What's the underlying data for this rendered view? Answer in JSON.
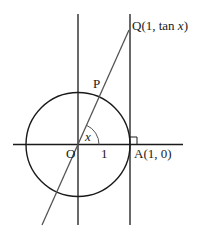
{
  "diagram": {
    "type": "unit-circle-tangent",
    "labels": {
      "Q": "Q(1, tan ",
      "Q_var": "x",
      "Q_close": ")",
      "P": "P",
      "O": "O",
      "one": "1",
      "A": "A(1, 0)",
      "angle": "x"
    },
    "colors": {
      "stroke": "#1a1a1a",
      "ray": "#555555",
      "background": "#ffffff"
    }
  }
}
